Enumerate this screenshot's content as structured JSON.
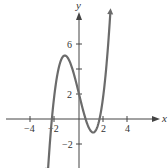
{
  "chart_data": {
    "type": "line",
    "title": "",
    "function": "y = x^3 - 4x + 2",
    "xlabel": "x",
    "ylabel": "y",
    "xlim": [
      -6,
      7.3
    ],
    "ylim": [
      -3.9,
      9.3
    ],
    "x_ticks": [
      -4,
      -2,
      2,
      4
    ],
    "y_ticks": [
      -2,
      2,
      6
    ],
    "y_tick_marks": [
      -2,
      2,
      4,
      6
    ],
    "x_tick_labels": [
      "-4",
      "-2",
      "2",
      "4"
    ],
    "y_tick_labels": [
      "-2",
      "2",
      "6"
    ],
    "grid": false,
    "legend": null,
    "series": [
      {
        "name": "curve",
        "color": "#6b6b6b",
        "x": [
          -2.55,
          -2.5,
          -2.25,
          -2,
          -1.75,
          -1.5,
          -1.15,
          -1,
          -0.75,
          -0.5,
          -0.25,
          0,
          0.25,
          0.5,
          0.75,
          1,
          1.15,
          1.25,
          1.5,
          1.75,
          2,
          2.25,
          2.5,
          2.62
        ],
        "y": [
          -4.38,
          -3.63,
          -0.39,
          2.0,
          3.64,
          4.63,
          5.08,
          5.0,
          4.58,
          3.88,
          2.98,
          2.0,
          1.02,
          0.13,
          -0.58,
          -1.0,
          -1.08,
          -1.05,
          -0.63,
          0.36,
          2.0,
          4.39,
          7.63,
          9.5
        ],
        "local_max": [
          -1.15,
          5.08
        ],
        "local_min": [
          1.15,
          -1.08
        ],
        "arrows": "both ends"
      }
    ]
  },
  "labels": {
    "x_axis": "x",
    "y_axis": "y",
    "ticks": {
      "xm4": "−4",
      "xm2": "−2",
      "x2": "2",
      "x4": "4",
      "y6": "6",
      "y2": "2",
      "ym2": "−2"
    }
  },
  "colors": {
    "axis": "#444444",
    "curve": "#6b6b6b",
    "text": "#333333"
  }
}
